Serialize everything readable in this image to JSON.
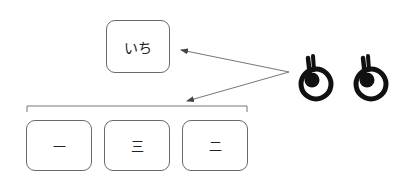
{
  "diagram": {
    "top_box": {
      "label": "いち"
    },
    "bottom_boxes": [
      {
        "label": "一"
      },
      {
        "label": "三"
      },
      {
        "label": "二"
      }
    ],
    "arrows": [
      {
        "from": "symbols",
        "to": "top_box"
      },
      {
        "from": "symbols",
        "to": "bottom_group"
      }
    ],
    "symbols": [
      {
        "icon": "ring-with-stem-icon"
      },
      {
        "icon": "ring-with-stem-icon"
      }
    ],
    "colors": {
      "box_border": "#6a6a6a",
      "arrow": "#555555",
      "symbol": "#111111"
    }
  }
}
